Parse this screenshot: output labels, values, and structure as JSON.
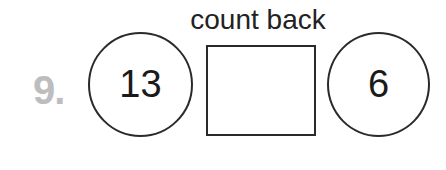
{
  "problem": {
    "number": "9.",
    "instruction": "count back",
    "start_value": "13",
    "answer_box": "",
    "end_value": "6"
  },
  "colors": {
    "problem_number": "#bdbdbd",
    "stroke": "#2a2a2a",
    "text": "#1a1a1a"
  }
}
